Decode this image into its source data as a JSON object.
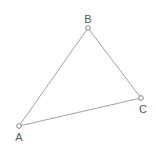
{
  "diagram": {
    "type": "triangle",
    "vertices": [
      {
        "id": "A",
        "label": "A",
        "x": 19,
        "y": 126,
        "label_x": 19,
        "label_y": 141
      },
      {
        "id": "B",
        "label": "B",
        "x": 88,
        "y": 28,
        "label_x": 88,
        "label_y": 23
      },
      {
        "id": "C",
        "label": "C",
        "x": 141,
        "y": 98,
        "label_x": 143,
        "label_y": 113
      }
    ],
    "edges": [
      {
        "from": "A",
        "to": "B"
      },
      {
        "from": "B",
        "to": "C"
      },
      {
        "from": "C",
        "to": "A"
      }
    ],
    "colors": {
      "edge": "#8a8a8a",
      "vertex_stroke": "#6a6a6a",
      "label": "#555555",
      "background": "#ffffff"
    }
  }
}
